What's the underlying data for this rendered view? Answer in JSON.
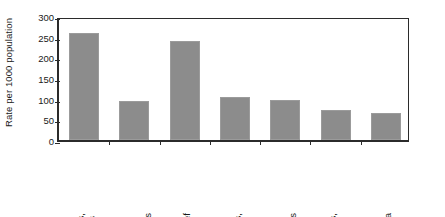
{
  "chart_data": {
    "type": "bar",
    "title": "",
    "subtitle": "",
    "xlabel": "",
    "ylabel": "Rate per 1000 population",
    "ylim": [
      0,
      300
    ],
    "yticks": [
      0,
      50,
      100,
      150,
      200,
      250,
      300
    ],
    "ytick_labels": [
      "0",
      "50",
      "100",
      "150",
      "200",
      "250",
      "300"
    ],
    "grid": false,
    "legend": null,
    "legend_position": "none",
    "bar_color": "#8c8c8c",
    "axis_color": "#2b2b2b",
    "background_color": "#ffffff",
    "categories": [
      "Vitamins, minerals",
      "Herbal, natural medications",
      "Pain relief",
      "Heart problems, blood",
      "Skin ointments",
      "Coughs, colds",
      "Asthma"
    ],
    "category_label_lines": [
      [
        "Vitamins,",
        "minerals"
      ],
      [
        "Herbal,",
        "natural",
        "medications"
      ],
      [
        "Pain relief"
      ],
      [
        "Heart",
        "problems,",
        "blood"
      ],
      [
        "Skin",
        "ointments"
      ],
      [
        "Coughs,",
        "colds"
      ],
      [
        "Asthma"
      ]
    ],
    "values": [
      259,
      94,
      239,
      104,
      97,
      72,
      65
    ],
    "annotations": []
  }
}
